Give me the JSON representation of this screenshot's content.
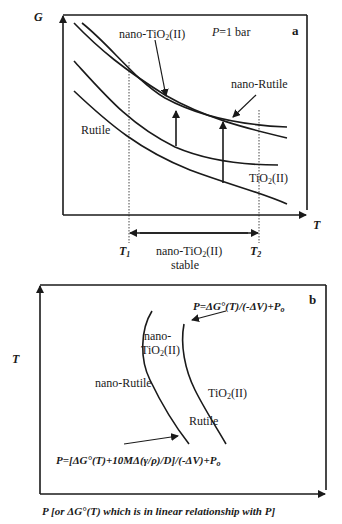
{
  "panel_a": {
    "panel_letter": "a",
    "y_axis_label": "G",
    "x_axis_label": "T",
    "condition": "P=1 bar",
    "curves": {
      "nano_tio2_ii": "nano-TiO2(II)",
      "nano_rutile": "nano-Rutile",
      "rutile": "Rutile",
      "tio2_ii": "TiO2(II)"
    },
    "t1": "T1",
    "t2": "T2",
    "stable_range_label": "nano-TiO2(II)",
    "stable_word": "stable"
  },
  "panel_b": {
    "panel_letter": "b",
    "y_axis_label": "T",
    "x_axis_label": "P [or ΔG°(T) which is in linear relationship with P]",
    "eq_bulk": "P=ΔG°(T)/(-ΔV)+Po",
    "eq_nano": "P=[ΔG°(T)+10MΔ(γ/ρ)/D]/(-ΔV)+Po",
    "region_labels": {
      "nano_tio2_ii_line1": "nano-",
      "nano_tio2_ii_line2": "TiO2(II)",
      "nano_rutile": "nano-Rutile",
      "tio2_ii": "TiO2(II)",
      "rutile": "Rutile"
    }
  }
}
